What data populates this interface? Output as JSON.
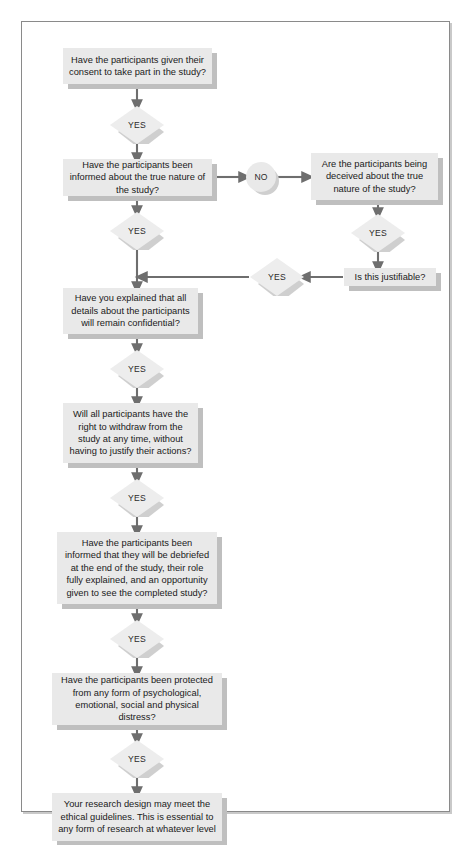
{
  "diagram": {
    "colors": {
      "node_fill": "#e9e9e9",
      "node_shadow": "#bfbfbf",
      "connector": "#6e6e6e",
      "frame_border": "#8a8a8a",
      "text": "#1a1a1a",
      "page_background": "#ffffff"
    },
    "nodes": {
      "q_consent": {
        "type": "process",
        "text": "Have the participants given their consent to take part in the study?"
      },
      "yes_consent": {
        "type": "decision",
        "text": "YES"
      },
      "q_informed": {
        "type": "process",
        "text": "Have the participants been informed about the true nature of the study?"
      },
      "no_informed": {
        "type": "connector-circle",
        "text": "NO"
      },
      "q_deceived": {
        "type": "process",
        "text": "Are the participants being deceived about the true nature of the study?"
      },
      "yes_deceived": {
        "type": "decision",
        "text": "YES"
      },
      "q_justifiable": {
        "type": "process",
        "text": "Is this justifiable?"
      },
      "yes_justifiable": {
        "type": "decision",
        "text": "YES"
      },
      "yes_informed": {
        "type": "decision",
        "text": "YES"
      },
      "q_confidential": {
        "type": "process",
        "text": "Have you explained that all details about the participants will remain confidential?"
      },
      "yes_confidential": {
        "type": "decision",
        "text": "YES"
      },
      "q_withdraw": {
        "type": "process",
        "text": "Will all participants have the right to withdraw from the study at any time, without having to justify their actions?"
      },
      "yes_withdraw": {
        "type": "decision",
        "text": "YES"
      },
      "q_debrief": {
        "type": "process",
        "text": "Have the participants been informed that they will be debriefed at the end of the study, their role fully explained, and an opportunity given to see the completed study?"
      },
      "yes_debrief": {
        "type": "decision",
        "text": "YES"
      },
      "q_protected": {
        "type": "process",
        "text": "Have the participants been protected from any form of psychological, emotional, social and physical distress?"
      },
      "yes_protected": {
        "type": "decision",
        "text": "YES"
      },
      "outcome": {
        "type": "terminator",
        "text": "Your research design may meet the ethical guidelines. This is essential to any form of research at whatever level"
      }
    }
  }
}
